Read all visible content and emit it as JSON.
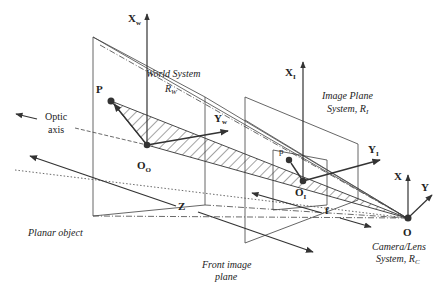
{
  "labels": {
    "world_axis_x": "X",
    "world_axis_x_sub": "w",
    "world_axis_y": "Y",
    "world_axis_y_sub": "w",
    "world_system_line1": "World System",
    "world_system_line2": "R",
    "world_system_sub": "W",
    "point_world": "P",
    "origin_object": "O",
    "origin_object_sub": "O",
    "optic_axis_line1": "Optic",
    "optic_axis_line2": "axis",
    "image_axis_x": "X",
    "image_axis_x_sub": "I",
    "image_axis_y": "Y",
    "image_axis_y_sub": "I",
    "image_plane_line1": "Image Plane",
    "image_plane_line2": "System, R",
    "image_plane_sub": "I",
    "point_image": "p",
    "origin_image": "O",
    "origin_image_sub": "I",
    "camera_axis_x": "X",
    "camera_axis_y": "Y",
    "camera_origin": "O",
    "depth_label": "Z",
    "focal_label": "f",
    "planar_object": "Planar object",
    "front_image_line1": "Front image",
    "front_image_line2": "plane",
    "camera_line1": "Camera/Lens",
    "camera_line2": "System, R",
    "camera_sub": "C"
  },
  "colors": {
    "stroke": "#333333",
    "plane": "#555555",
    "text": "#222222"
  }
}
